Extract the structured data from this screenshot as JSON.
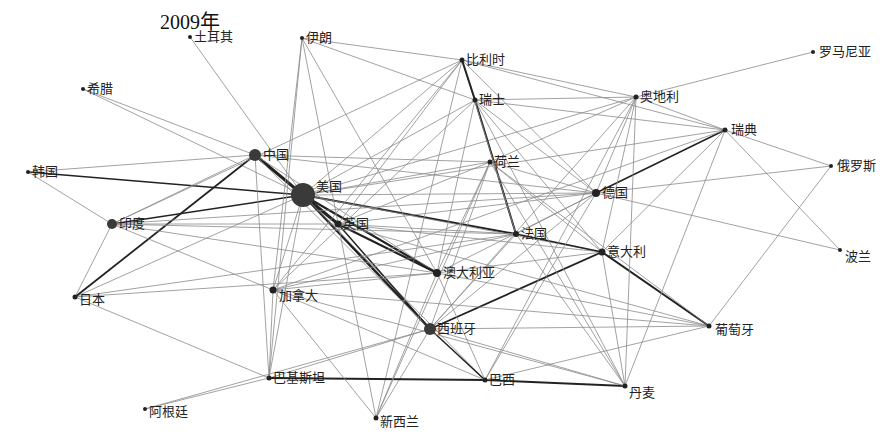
{
  "title": "2009年",
  "chart_data": {
    "type": "network",
    "title": "2009年",
    "nodes": [
      {
        "id": "turkey",
        "label": "土耳其",
        "x": 190,
        "y": 37,
        "r": 2,
        "lx": 4,
        "ly": -7
      },
      {
        "id": "iran",
        "label": "伊朗",
        "x": 302,
        "y": 38,
        "r": 2,
        "lx": 4,
        "ly": -7
      },
      {
        "id": "belgium",
        "label": "比利时",
        "x": 462,
        "y": 60,
        "r": 2.5,
        "lx": 4,
        "ly": -7
      },
      {
        "id": "romania",
        "label": "罗马尼亚",
        "x": 813,
        "y": 52,
        "r": 2,
        "lx": 6,
        "ly": -7
      },
      {
        "id": "greece",
        "label": "希腊",
        "x": 83,
        "y": 89,
        "r": 2,
        "lx": 4,
        "ly": -7
      },
      {
        "id": "switzerland",
        "label": "瑞士",
        "x": 475,
        "y": 100,
        "r": 2.5,
        "lx": 4,
        "ly": -7
      },
      {
        "id": "austria",
        "label": "奥地利",
        "x": 636,
        "y": 97,
        "r": 2.5,
        "lx": 4,
        "ly": -7
      },
      {
        "id": "sweden",
        "label": "瑞典",
        "x": 725,
        "y": 130,
        "r": 2.5,
        "lx": 6,
        "ly": -7
      },
      {
        "id": "china",
        "label": "中国",
        "x": 255,
        "y": 155,
        "r": 6,
        "lx": 8,
        "ly": -7
      },
      {
        "id": "korea",
        "label": "韩国",
        "x": 28,
        "y": 172,
        "r": 2,
        "lx": 4,
        "ly": -7
      },
      {
        "id": "netherlands",
        "label": "荷兰",
        "x": 490,
        "y": 162,
        "r": 2.5,
        "lx": 4,
        "ly": -7
      },
      {
        "id": "russia",
        "label": "俄罗斯",
        "x": 831,
        "y": 166,
        "r": 2,
        "lx": 6,
        "ly": -7
      },
      {
        "id": "usa",
        "label": "美国",
        "x": 303,
        "y": 195,
        "r": 12,
        "lx": 13,
        "ly": -15
      },
      {
        "id": "germany",
        "label": "德国",
        "x": 596,
        "y": 193,
        "r": 4,
        "lx": 6,
        "ly": -7
      },
      {
        "id": "india",
        "label": "印度",
        "x": 112,
        "y": 224,
        "r": 5,
        "lx": 7,
        "ly": -7
      },
      {
        "id": "uk",
        "label": "英国",
        "x": 338,
        "y": 224,
        "r": 3.5,
        "lx": 5,
        "ly": -7
      },
      {
        "id": "france",
        "label": "法国",
        "x": 516,
        "y": 234,
        "r": 3,
        "lx": 5,
        "ly": -7
      },
      {
        "id": "italy",
        "label": "意大利",
        "x": 602,
        "y": 252,
        "r": 3.5,
        "lx": 5,
        "ly": -7
      },
      {
        "id": "poland",
        "label": "波兰",
        "x": 840,
        "y": 250,
        "r": 2,
        "lx": 5,
        "ly": 0
      },
      {
        "id": "australia",
        "label": "澳大利亚",
        "x": 437,
        "y": 273,
        "r": 4,
        "lx": 6,
        "ly": -7
      },
      {
        "id": "canada",
        "label": "加拿大",
        "x": 273,
        "y": 290,
        "r": 3.5,
        "lx": 6,
        "ly": -1
      },
      {
        "id": "japan",
        "label": "日本",
        "x": 75,
        "y": 297,
        "r": 2.5,
        "lx": 4,
        "ly": -4
      },
      {
        "id": "spain",
        "label": "西班牙",
        "x": 430,
        "y": 329,
        "r": 6,
        "lx": 7,
        "ly": -7
      },
      {
        "id": "portugal",
        "label": "葡萄牙",
        "x": 709,
        "y": 326,
        "r": 2.5,
        "lx": 6,
        "ly": -3
      },
      {
        "id": "pakistan",
        "label": "巴基斯坦",
        "x": 269,
        "y": 378,
        "r": 2.5,
        "lx": 4,
        "ly": -7
      },
      {
        "id": "brazil",
        "label": "巴西",
        "x": 485,
        "y": 380,
        "r": 2.5,
        "lx": 4,
        "ly": -7
      },
      {
        "id": "denmark",
        "label": "丹麦",
        "x": 625,
        "y": 386,
        "r": 2.5,
        "lx": 4,
        "ly": 0
      },
      {
        "id": "argentina",
        "label": "阿根廷",
        "x": 145,
        "y": 409,
        "r": 2,
        "lx": 4,
        "ly": -4
      },
      {
        "id": "newzealand",
        "label": "新西兰",
        "x": 376,
        "y": 418,
        "r": 2.5,
        "lx": 4,
        "ly": -3
      }
    ],
    "edges": [
      [
        "usa",
        "china",
        3
      ],
      [
        "usa",
        "uk",
        3
      ],
      [
        "usa",
        "france",
        2
      ],
      [
        "usa",
        "australia",
        2.2
      ],
      [
        "usa",
        "spain",
        2.5
      ],
      [
        "usa",
        "korea",
        1.5
      ],
      [
        "usa",
        "india",
        1.5
      ],
      [
        "usa",
        "germany",
        1
      ],
      [
        "usa",
        "netherlands",
        1
      ],
      [
        "usa",
        "greece",
        1
      ],
      [
        "usa",
        "italy",
        1
      ],
      [
        "usa",
        "canada",
        1
      ],
      [
        "usa",
        "japan",
        1
      ],
      [
        "usa",
        "pakistan",
        1
      ],
      [
        "usa",
        "brazil",
        1
      ],
      [
        "usa",
        "switzerland",
        1
      ],
      [
        "usa",
        "belgium",
        1
      ],
      [
        "usa",
        "turkey",
        1
      ],
      [
        "usa",
        "sweden",
        1
      ],
      [
        "usa",
        "austria",
        1
      ],
      [
        "china",
        "japan",
        1.8
      ],
      [
        "china",
        "india",
        1
      ],
      [
        "china",
        "korea",
        1
      ],
      [
        "china",
        "greece",
        1
      ],
      [
        "china",
        "germany",
        1
      ],
      [
        "china",
        "pakistan",
        1
      ],
      [
        "china",
        "australia",
        1
      ],
      [
        "china",
        "netherlands",
        1
      ],
      [
        "china",
        "spain",
        1
      ],
      [
        "uk",
        "australia",
        2.2
      ],
      [
        "uk",
        "spain",
        1.5
      ],
      [
        "uk",
        "france",
        1
      ],
      [
        "uk",
        "germany",
        1
      ],
      [
        "uk",
        "italy",
        1
      ],
      [
        "uk",
        "india",
        1
      ],
      [
        "uk",
        "netherlands",
        1
      ],
      [
        "uk",
        "belgium",
        1
      ],
      [
        "uk",
        "portugal",
        1
      ],
      [
        "france",
        "italy",
        1.5
      ],
      [
        "france",
        "germany",
        1
      ],
      [
        "france",
        "spain",
        1
      ],
      [
        "france",
        "switzerland",
        2
      ],
      [
        "france",
        "belgium",
        1
      ],
      [
        "france",
        "india",
        1
      ],
      [
        "france",
        "japan",
        1
      ],
      [
        "france",
        "canada",
        1
      ],
      [
        "germany",
        "austria",
        1
      ],
      [
        "germany",
        "sweden",
        1.5
      ],
      [
        "germany",
        "russia",
        1
      ],
      [
        "germany",
        "poland",
        1
      ],
      [
        "germany",
        "netherlands",
        1
      ],
      [
        "germany",
        "switzerland",
        1
      ],
      [
        "germany",
        "belgium",
        1
      ],
      [
        "germany",
        "india",
        1
      ],
      [
        "germany",
        "spain",
        1
      ],
      [
        "germany",
        "brazil",
        1
      ],
      [
        "germany",
        "australia",
        1
      ],
      [
        "italy",
        "portugal",
        2
      ],
      [
        "italy",
        "spain",
        1.8
      ],
      [
        "italy",
        "austria",
        1
      ],
      [
        "italy",
        "sweden",
        1
      ],
      [
        "italy",
        "switzerland",
        1
      ],
      [
        "italy",
        "netherlands",
        1
      ],
      [
        "italy",
        "australia",
        1
      ],
      [
        "italy",
        "denmark",
        1
      ],
      [
        "switzerland",
        "belgium",
        2
      ],
      [
        "switzerland",
        "iran",
        1
      ],
      [
        "switzerland",
        "austria",
        1
      ],
      [
        "switzerland",
        "sweden",
        1
      ],
      [
        "switzerland",
        "canada",
        1
      ],
      [
        "switzerland",
        "australia",
        1
      ],
      [
        "switzerland",
        "denmark",
        1
      ],
      [
        "belgium",
        "iran",
        1
      ],
      [
        "belgium",
        "austria",
        1
      ],
      [
        "belgium",
        "sweden",
        1
      ],
      [
        "belgium",
        "india",
        1
      ],
      [
        "belgium",
        "canada",
        1
      ],
      [
        "belgium",
        "newzealand",
        1
      ],
      [
        "austria",
        "romania",
        1
      ],
      [
        "austria",
        "sweden",
        1
      ],
      [
        "austria",
        "netherlands",
        1
      ],
      [
        "austria",
        "spain",
        1
      ],
      [
        "austria",
        "denmark",
        1
      ],
      [
        "austria",
        "brazil",
        1
      ],
      [
        "sweden",
        "russia",
        1
      ],
      [
        "sweden",
        "poland",
        1
      ],
      [
        "sweden",
        "denmark",
        1
      ],
      [
        "sweden",
        "canada",
        1
      ],
      [
        "russia",
        "portugal",
        1
      ],
      [
        "iran",
        "canada",
        1
      ],
      [
        "iran",
        "australia",
        1
      ],
      [
        "iran",
        "pakistan",
        1
      ],
      [
        "iran",
        "newzealand",
        1
      ],
      [
        "spain",
        "brazil",
        1.5
      ],
      [
        "spain",
        "portugal",
        1
      ],
      [
        "spain",
        "pakistan",
        1
      ],
      [
        "spain",
        "denmark",
        1
      ],
      [
        "spain",
        "newzealand",
        1
      ],
      [
        "spain",
        "argentina",
        1
      ],
      [
        "spain",
        "netherlands",
        1
      ],
      [
        "pakistan",
        "brazil",
        1.8
      ],
      [
        "pakistan",
        "argentina",
        1
      ],
      [
        "pakistan",
        "japan",
        1
      ],
      [
        "pakistan",
        "canada",
        1
      ],
      [
        "brazil",
        "denmark",
        1.8
      ],
      [
        "brazil",
        "portugal",
        1
      ],
      [
        "brazil",
        "canada",
        1
      ],
      [
        "brazil",
        "australia",
        1
      ],
      [
        "denmark",
        "canada",
        1
      ],
      [
        "denmark",
        "netherlands",
        1
      ],
      [
        "denmark",
        "france",
        1
      ],
      [
        "newzealand",
        "australia",
        1
      ],
      [
        "newzealand",
        "canada",
        1
      ],
      [
        "newzealand",
        "netherlands",
        1
      ],
      [
        "india",
        "korea",
        1
      ],
      [
        "india",
        "japan",
        1
      ],
      [
        "india",
        "australia",
        1
      ],
      [
        "india",
        "canada",
        1
      ],
      [
        "japan",
        "australia",
        1
      ],
      [
        "portugal",
        "australia",
        1
      ],
      [
        "portugal",
        "canada",
        1
      ],
      [
        "portugal",
        "netherlands",
        1
      ],
      [
        "canada",
        "australia",
        1
      ],
      [
        "netherlands",
        "australia",
        1
      ]
    ]
  }
}
